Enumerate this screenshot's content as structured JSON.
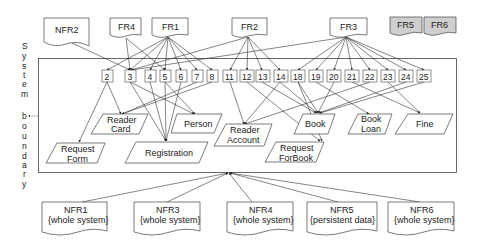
{
  "diagram": {
    "type": "requirements-traceability / domain model",
    "vertical_label": [
      "S",
      "y",
      "s",
      "t",
      "e",
      "m",
      "",
      "b",
      "o",
      "u",
      "n",
      "d",
      "a",
      "r",
      "y"
    ],
    "boundary_label": "System boundary",
    "top_requirements": [
      {
        "id": "NFR2",
        "label": "NFR2",
        "shaded": false
      },
      {
        "id": "FR4",
        "label": "FR4",
        "shaded": false
      },
      {
        "id": "FR1",
        "label": "FR1",
        "shaded": false
      },
      {
        "id": "FR2",
        "label": "FR2",
        "shaded": false
      },
      {
        "id": "FR3",
        "label": "FR3",
        "shaded": false
      },
      {
        "id": "FR5",
        "label": "FR5",
        "shaded": true
      },
      {
        "id": "FR6",
        "label": "FR6",
        "shaded": true
      }
    ],
    "use_cases": [
      "2",
      "3",
      "4",
      "5",
      "6",
      "7",
      "8",
      "11",
      "12",
      "13",
      "14",
      "18",
      "19",
      "20",
      "21",
      "22",
      "23",
      "24",
      "25"
    ],
    "entities": [
      {
        "id": "reader-card",
        "line1": "Reader",
        "line2": "Card"
      },
      {
        "id": "person",
        "line1": "Person",
        "line2": ""
      },
      {
        "id": "request-form",
        "line1": "Request",
        "line2": "Form"
      },
      {
        "id": "registration",
        "line1": "Registration",
        "line2": ""
      },
      {
        "id": "reader-account",
        "line1": "Reader",
        "line2": "Account"
      },
      {
        "id": "request-forbook",
        "line1": "Request",
        "line2": "ForBook"
      },
      {
        "id": "book",
        "line1": "Book",
        "line2": ""
      },
      {
        "id": "book-loan",
        "line1": "Book",
        "line2": "Loan"
      },
      {
        "id": "fine",
        "line1": "Fine",
        "line2": ""
      }
    ],
    "bottom_requirements": [
      {
        "id": "NFR1",
        "line1": "NFR1",
        "line2": "{whole system}"
      },
      {
        "id": "NFR3",
        "line1": "NFR3",
        "line2": "{whole system}"
      },
      {
        "id": "NFR4",
        "line1": "NFR4",
        "line2": "{whole system}"
      },
      {
        "id": "NFR5",
        "line1": "NFR5",
        "line2": "{persistent data}"
      },
      {
        "id": "NFR6",
        "line1": "NFR6",
        "line2": "{whole system}"
      }
    ],
    "colors": {
      "line": "#333333",
      "shaded_fill": "#cfcfcf",
      "box_fill": "#ffffff"
    }
  }
}
